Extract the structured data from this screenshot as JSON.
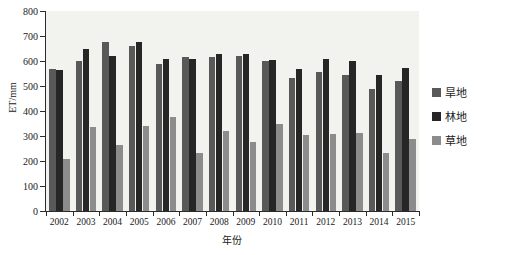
{
  "chart_data": {
    "type": "bar",
    "title": "",
    "xlabel": "年份",
    "ylabel": "ET/mm",
    "ylim": [
      0,
      800
    ],
    "ytick_step": 100,
    "yticks": [
      0,
      100,
      200,
      300,
      400,
      500,
      600,
      700,
      800
    ],
    "grid": false,
    "legend_position": "right",
    "categories": [
      "2002",
      "2003",
      "2004",
      "2005",
      "2006",
      "2007",
      "2008",
      "2009",
      "2010",
      "2011",
      "2012",
      "2013",
      "2014",
      "2015"
    ],
    "series": [
      {
        "name": "旱地",
        "color": "#595959",
        "values": [
          570,
          602,
          675,
          662,
          588,
          617,
          615,
          622,
          602,
          533,
          558,
          545,
          487,
          520
        ]
      },
      {
        "name": "林地",
        "color": "#262626",
        "values": [
          565,
          648,
          622,
          678,
          610,
          607,
          628,
          627,
          605,
          567,
          608,
          600,
          543,
          572
        ]
      },
      {
        "name": "草地",
        "color": "#8c8c8c",
        "values": [
          207,
          337,
          263,
          340,
          375,
          233,
          322,
          278,
          350,
          305,
          310,
          312,
          232,
          288
        ]
      }
    ]
  },
  "legend": {
    "items": [
      {
        "label": "旱地",
        "color": "#595959"
      },
      {
        "label": "林地",
        "color": "#262626"
      },
      {
        "label": "草地",
        "color": "#8c8c8c"
      }
    ]
  },
  "axes": {
    "y_title": "ET/mm",
    "x_title": "年份"
  },
  "colors": {
    "plot_background": "#f2f2ef",
    "axis": "#2b2b2b",
    "text": "#1a1a1a"
  }
}
